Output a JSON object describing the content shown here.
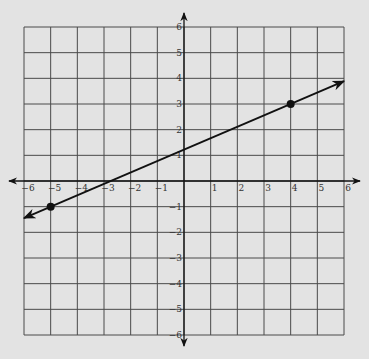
{
  "chart_data": {
    "type": "line",
    "title": "",
    "xlabel": "",
    "ylabel": "",
    "xlim": [
      -6,
      6
    ],
    "ylim": [
      -6,
      6
    ],
    "grid": true,
    "x_ticks": [
      -6,
      -5,
      -4,
      -3,
      -2,
      -1,
      1,
      2,
      3,
      4,
      5,
      6
    ],
    "y_ticks": [
      -6,
      -5,
      -4,
      -3,
      -2,
      -1,
      1,
      2,
      3,
      4,
      5,
      6
    ],
    "x_tick_labels": [
      "−6",
      "−5",
      "−4",
      "−3",
      "−2",
      "−1",
      "1",
      "2",
      "3",
      "4",
      "5",
      "6"
    ],
    "y_tick_labels": [
      "−6",
      "−5",
      "−4",
      "−3",
      "−2",
      "−1",
      "1",
      "2",
      "3",
      "4",
      "5",
      "6"
    ],
    "series": [
      {
        "name": "line",
        "kind": "line-with-arrows",
        "slope": 0.4444,
        "intercept": 1.2222,
        "marked_points": [
          {
            "x": -5,
            "y": -1
          },
          {
            "x": 4,
            "y": 3
          }
        ],
        "extent": {
          "x_start": -6,
          "x_end": 6
        }
      }
    ]
  },
  "colors": {
    "background": "#e3e3e3",
    "grid": "#4a4a4a",
    "axis": "#111111",
    "line": "#111111",
    "point": "#111111"
  }
}
